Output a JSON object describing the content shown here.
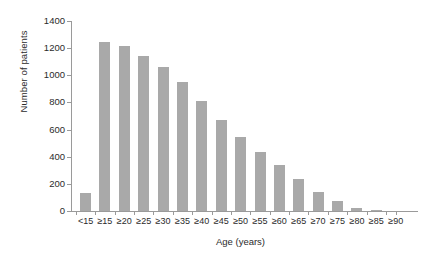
{
  "chart_data": {
    "type": "bar",
    "title": "",
    "xlabel": "Age (years)",
    "ylabel": "Number of patients",
    "categories": [
      "<15",
      "≥15",
      "≥20",
      "≥25",
      "≥30",
      "≥35",
      "≥40",
      "≥45",
      "≥50",
      "≥55",
      "≥60",
      "≥65",
      "≥70",
      "≥75",
      "≥80",
      "≥85",
      "≥90"
    ],
    "values": [
      130,
      1245,
      1215,
      1145,
      1060,
      950,
      810,
      670,
      545,
      435,
      340,
      235,
      140,
      75,
      25,
      5,
      0
    ],
    "ylim": [
      0,
      1400
    ],
    "yticks": [
      0,
      200,
      400,
      600,
      800,
      1000,
      1200,
      1400
    ],
    "ytick_labels": [
      "0",
      "200",
      "400",
      "600",
      "800",
      "1000",
      "1200",
      "1400"
    ],
    "grid": false,
    "legend": null,
    "bar_color": "#a9a9a9",
    "axis_color": "#9a9a9a",
    "text_color": "#2b2b2b"
  }
}
